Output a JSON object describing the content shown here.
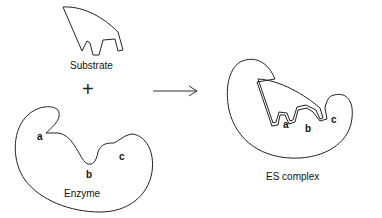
{
  "diagram": {
    "type": "enzyme-substrate lock-and-key",
    "labels": {
      "substrate": "Substrate",
      "plus": "+",
      "enzyme": "Enzyme",
      "complex": "ES complex"
    },
    "binding_sites": {
      "enzyme": [
        "a",
        "b",
        "c"
      ],
      "complex": [
        "a",
        "b",
        "c"
      ]
    },
    "colors": {
      "stroke": "#222222",
      "background": "#ffffff"
    }
  }
}
